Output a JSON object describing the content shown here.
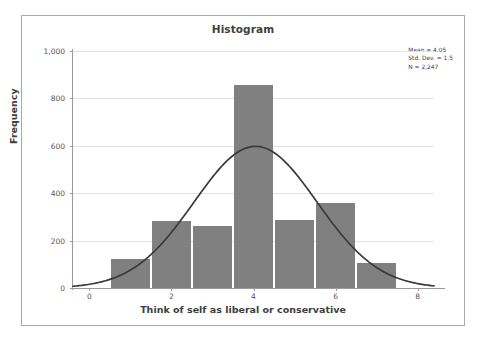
{
  "chart_data": {
    "type": "bar",
    "title": "Histogram",
    "xlabel": "Think of self as liberal or conservative",
    "ylabel": "Frequency",
    "categories": [
      1,
      2,
      3,
      4,
      5,
      6,
      7
    ],
    "values": [
      122,
      283,
      262,
      856,
      288,
      358,
      105
    ],
    "bin_width": 1,
    "xlim": [
      -0.4,
      8.4
    ],
    "ylim": [
      0,
      1000
    ],
    "x_ticks": [
      "0",
      "2",
      "4",
      "6",
      "8"
    ],
    "x_tick_values": [
      0,
      2,
      4,
      6,
      8
    ],
    "y_ticks": [
      "0",
      "200",
      "400",
      "600",
      "800",
      "1,000"
    ],
    "y_tick_values": [
      0,
      200,
      400,
      600,
      800,
      1000
    ],
    "grid": "horizontal",
    "legend": "none",
    "bar_color": "#808080",
    "curve_color": "#3a3a3a",
    "overlay": {
      "type": "normal-curve",
      "mean": 4.05,
      "std_dev": 1.5,
      "n": 2247,
      "peak_frequency": 598
    },
    "annotations": {
      "mean": "Mean = 4.05",
      "std_dev": "Std. Dev. = 1.5",
      "n": "N = 2,247"
    }
  }
}
